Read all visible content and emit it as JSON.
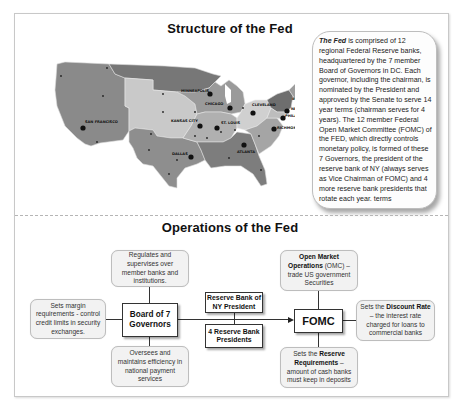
{
  "structure": {
    "title": "Structure of the Fed",
    "map": {
      "cities": [
        {
          "name": "SAN FRANCISCO",
          "x": 42,
          "y": 68
        },
        {
          "name": "MINNEAPOLIS",
          "x": 164,
          "y": 34
        },
        {
          "name": "KANSAS CITY",
          "x": 155,
          "y": 66
        },
        {
          "name": "CHICAGO",
          "x": 184,
          "y": 49
        },
        {
          "name": "ST. LOUIS",
          "x": 173,
          "y": 68
        },
        {
          "name": "CLEVELAND",
          "x": 210,
          "y": 53
        },
        {
          "name": "BOSTON",
          "x": 259,
          "y": 47
        },
        {
          "name": "NEW YORK",
          "x": 245,
          "y": 52
        },
        {
          "name": "PHILADELPHIA",
          "x": 240,
          "y": 59
        },
        {
          "name": "RICHMOND",
          "x": 229,
          "y": 70
        },
        {
          "name": "DALLAS",
          "x": 146,
          "y": 98
        },
        {
          "name": "ATLANTA",
          "x": 199,
          "y": 89
        }
      ]
    },
    "info_lead": "The Fed",
    "info_text": " is comprised of 12 regional Federal Reserve banks, headquartered by the 7 member Board of Governors in DC. Each governor, including the chairman, is nominated by the President and approved by the Senate to serve 14 year terms (chairman serves for 4 years). The 12 member Federal Open Market Committee (FOMC) of the FED, which directly controls monetary policy, is formed of these 7 Governors, the president of the reserve bank of NY (always serves as Vice Chairman of FOMC) and 4 more reserve bank presidents that rotate each year. terms"
  },
  "operations": {
    "title": "Operations of the Fed",
    "board": {
      "line1": "Board of 7",
      "line2": "Governors"
    },
    "ny_president": {
      "line1": "Reserve Bank of",
      "line2": "NY President"
    },
    "reserve_presidents": {
      "line1": "4 Reserve Bank",
      "line2": "Presidents"
    },
    "fomc": "FOMC",
    "callouts": {
      "regulates": "Regulates and supervises over member banks and institutions.",
      "margin": "Sets margin requirements - control credit limits in security exchanges.",
      "oversees": "Oversees and maintains efficiency in national payment services",
      "omo_bold": "Open Market Operations",
      "omo_rest": " (OMC) – trade US government Securities",
      "discount_pre": "Sets the ",
      "discount_bold": "Discount Rate",
      "discount_rest": " – the interest rate charged for loans to commercial banks",
      "reserve_pre": "Sets the ",
      "reserve_bold": "Reserve Requirements",
      "reserve_rest": " – amount of cash banks must keep in deposits"
    }
  }
}
